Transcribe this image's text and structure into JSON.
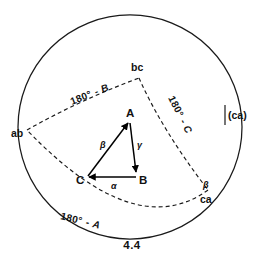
{
  "figure": {
    "caption": "4.4",
    "caption_name": "figure-caption"
  },
  "outer_circle": {
    "name": "great-circle",
    "center_x": 130,
    "center_y": 127,
    "radius": 112,
    "color": "#1a1a1a",
    "style": "solid"
  },
  "vertices": [
    {
      "id": "ab",
      "label": "ab",
      "x": 20,
      "y": 133
    },
    {
      "id": "bc",
      "label": "bc",
      "x": 139,
      "y": 70
    },
    {
      "id": "ca",
      "label": "ca",
      "x": 208,
      "y": 196
    },
    {
      "id": "ca_paren",
      "label": "(ca)",
      "x": 232,
      "y": 115
    }
  ],
  "arcs": [
    {
      "id": "arc-ab-bc",
      "label": "180° - B",
      "angle_symbol": "B",
      "style": "dashed"
    },
    {
      "id": "arc-bc-ca",
      "label": "180° - C",
      "angle_symbol": "C",
      "style": "dashed"
    },
    {
      "id": "arc-ca-ab",
      "label": "180° - A",
      "angle_symbol": "A",
      "style": "dashed"
    }
  ],
  "arc_labels": {
    "prefix": "180°",
    "dash": "-",
    "b": "B",
    "c": "C",
    "a": "A"
  },
  "beta_at_ca": {
    "label": "β",
    "name": "beta-angle-at-ca"
  },
  "inner_triangle": {
    "name": "vector-triangle",
    "vertices": [
      {
        "id": "A",
        "label": "A",
        "x": 131,
        "y": 116
      },
      {
        "id": "B",
        "label": "B",
        "x": 141,
        "y": 178
      },
      {
        "id": "C",
        "label": "C",
        "x": 84,
        "y": 178
      }
    ],
    "vectors": [
      {
        "id": "CA",
        "from": "C",
        "to": "A",
        "label": "β",
        "name": "vector-c-to-a"
      },
      {
        "id": "AB",
        "from": "A",
        "to": "B",
        "label": "γ",
        "name": "vector-a-to-b"
      },
      {
        "id": "BC",
        "from": "B",
        "to": "C",
        "label": "α",
        "name": "vector-b-to-c"
      }
    ]
  },
  "colors": {
    "ink": "#1a1a1a",
    "background": "#ffffff"
  }
}
